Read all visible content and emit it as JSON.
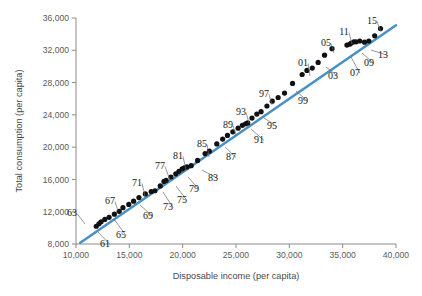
{
  "chart_data": {
    "type": "scatter",
    "title": "",
    "subtitle": "",
    "xlabel": "Disposable income (per capita)",
    "ylabel": "Total consumption (per capita)",
    "xlim": [
      10000,
      40000
    ],
    "ylim": [
      8000,
      36000
    ],
    "xticks": [
      10000,
      15000,
      20000,
      25000,
      30000,
      35000,
      40000
    ],
    "yticks": [
      8000,
      12000,
      16000,
      20000,
      24000,
      28000,
      32000,
      36000
    ],
    "xtick_labels": [
      "10,000",
      "15,000",
      "20,000",
      "25,000",
      "30,000",
      "35,000",
      "40,000"
    ],
    "ytick_labels": [
      "8,000",
      "12,000",
      "16,000",
      "20,000",
      "24,000",
      "28,000",
      "32,000",
      "36,000"
    ],
    "grid": false,
    "legend": null,
    "series_name": "Annual observations 1961-2015",
    "point_color": "#111111",
    "trendline": {
      "type": "linear-fit",
      "color": "#4a90c4",
      "x_start": 10400,
      "y_start": 8150,
      "x_end": 40000,
      "y_end": 35100
    },
    "points": [
      {
        "label": "61",
        "x": 11900,
        "y": 10200
      },
      {
        "label": "62",
        "x": 12150,
        "y": 10500
      },
      {
        "label": "63",
        "x": 12350,
        "y": 10750
      },
      {
        "label": "64",
        "x": 12700,
        "y": 11050
      },
      {
        "label": "65",
        "x": 13100,
        "y": 11300
      },
      {
        "label": "66",
        "x": 13600,
        "y": 11700
      },
      {
        "label": "67",
        "x": 14050,
        "y": 12050
      },
      {
        "label": "68",
        "x": 14400,
        "y": 12500
      },
      {
        "label": "69",
        "x": 14950,
        "y": 12900
      },
      {
        "label": "70",
        "x": 15400,
        "y": 13300
      },
      {
        "label": "71",
        "x": 15900,
        "y": 13750
      },
      {
        "label": "72",
        "x": 16500,
        "y": 14200
      },
      {
        "label": "73",
        "x": 17050,
        "y": 14500
      },
      {
        "label": "74",
        "x": 17400,
        "y": 14600
      },
      {
        "label": "75",
        "x": 17900,
        "y": 15200
      },
      {
        "label": "76",
        "x": 18250,
        "y": 15750
      },
      {
        "label": "77",
        "x": 18450,
        "y": 15900
      },
      {
        "label": "78",
        "x": 18900,
        "y": 16300
      },
      {
        "label": "79",
        "x": 19350,
        "y": 16700
      },
      {
        "label": "80",
        "x": 19650,
        "y": 17000
      },
      {
        "label": "81",
        "x": 19950,
        "y": 17300
      },
      {
        "label": "82",
        "x": 20150,
        "y": 17450
      },
      {
        "label": "83",
        "x": 20400,
        "y": 17550
      },
      {
        "label": "84",
        "x": 20800,
        "y": 17700
      },
      {
        "label": "85",
        "x": 21400,
        "y": 18350
      },
      {
        "label": "86",
        "x": 22100,
        "y": 19200
      },
      {
        "label": "87",
        "x": 22500,
        "y": 19500
      },
      {
        "label": "88",
        "x": 23200,
        "y": 20400
      },
      {
        "label": "89",
        "x": 23750,
        "y": 21000
      },
      {
        "label": "90",
        "x": 24200,
        "y": 21450
      },
      {
        "label": "91",
        "x": 24700,
        "y": 21900
      },
      {
        "label": "92",
        "x": 25200,
        "y": 22350
      },
      {
        "label": "93",
        "x": 25600,
        "y": 22700
      },
      {
        "label": "94",
        "x": 25900,
        "y": 22900
      },
      {
        "label": "95",
        "x": 26100,
        "y": 23000
      },
      {
        "label": "96",
        "x": 26500,
        "y": 23600
      },
      {
        "label": "97",
        "x": 26950,
        "y": 24100
      },
      {
        "label": "98",
        "x": 27350,
        "y": 24400
      },
      {
        "label": "99",
        "x": 27900,
        "y": 25100
      },
      {
        "label": "00",
        "x": 28400,
        "y": 25700
      },
      {
        "label": "01",
        "x": 28950,
        "y": 26150
      },
      {
        "label": "02",
        "x": 29550,
        "y": 26700
      },
      {
        "label": "03",
        "x": 30300,
        "y": 27900
      },
      {
        "label": "04",
        "x": 31200,
        "y": 29000
      },
      {
        "label": "05",
        "x": 31650,
        "y": 29500
      },
      {
        "label": "06",
        "x": 32150,
        "y": 29800
      },
      {
        "label": "07",
        "x": 32700,
        "y": 30500
      },
      {
        "label": "08",
        "x": 33300,
        "y": 31400
      },
      {
        "label": "09",
        "x": 34000,
        "y": 32200
      },
      {
        "label": "10",
        "x": 35400,
        "y": 32650
      },
      {
        "label": "11",
        "x": 35650,
        "y": 32750
      },
      {
        "label": "12",
        "x": 35800,
        "y": 32900
      },
      {
        "label": "13",
        "x": 36050,
        "y": 33050
      },
      {
        "label": "14",
        "x": 36250,
        "y": 33050
      },
      {
        "label": "15",
        "x": 36600,
        "y": 33150
      },
      {
        "label": "16",
        "x": 37050,
        "y": 33000
      },
      {
        "label": "17",
        "x": 37450,
        "y": 33150
      },
      {
        "label": "18",
        "x": 38000,
        "y": 33800
      },
      {
        "label": "19",
        "x": 38550,
        "y": 34700
      }
    ],
    "annotations": [
      {
        "text": "63",
        "x": 72,
        "y": 212,
        "lx": 85,
        "ly": 224
      },
      {
        "text": "61",
        "x": 105,
        "y": 243,
        "lx": 98,
        "ly": 232
      },
      {
        "text": "65",
        "x": 121,
        "y": 234,
        "lx": 114,
        "ly": 219
      },
      {
        "text": "67",
        "x": 110,
        "y": 200,
        "lx": 118,
        "ly": 211
      },
      {
        "text": "69",
        "x": 148,
        "y": 215,
        "lx": 140,
        "ly": 205
      },
      {
        "text": "71",
        "x": 137,
        "y": 182,
        "lx": 145,
        "ly": 196
      },
      {
        "text": "73",
        "x": 168,
        "y": 206,
        "lx": 163,
        "ly": 192
      },
      {
        "text": "75",
        "x": 182,
        "y": 199,
        "lx": 176,
        "ly": 186
      },
      {
        "text": "77",
        "x": 160,
        "y": 165,
        "lx": 170,
        "ly": 180
      },
      {
        "text": "79",
        "x": 194,
        "y": 188,
        "lx": 188,
        "ly": 177
      },
      {
        "text": "81",
        "x": 178,
        "y": 155,
        "lx": 186,
        "ly": 170
      },
      {
        "text": "83",
        "x": 213,
        "y": 177,
        "lx": 202,
        "ly": 170
      },
      {
        "text": "85",
        "x": 202,
        "y": 143,
        "lx": 209,
        "ly": 157
      },
      {
        "text": "87",
        "x": 231,
        "y": 156,
        "lx": 225,
        "ly": 147
      },
      {
        "text": "89",
        "x": 228,
        "y": 124,
        "lx": 236,
        "ly": 136
      },
      {
        "text": "91",
        "x": 259,
        "y": 139,
        "lx": 251,
        "ly": 129
      },
      {
        "text": "93",
        "x": 241,
        "y": 111,
        "lx": 249,
        "ly": 123
      },
      {
        "text": "95",
        "x": 272,
        "y": 125,
        "lx": 264,
        "ly": 118
      },
      {
        "text": "97",
        "x": 264,
        "y": 93,
        "lx": 272,
        "ly": 105
      },
      {
        "text": "99",
        "x": 303,
        "y": 100,
        "lx": 296,
        "ly": 91
      },
      {
        "text": "01",
        "x": 303,
        "y": 62,
        "lx": 310,
        "ly": 76
      },
      {
        "text": "03",
        "x": 333,
        "y": 75,
        "lx": 326,
        "ly": 67
      },
      {
        "text": "05",
        "x": 326,
        "y": 42,
        "lx": 334,
        "ly": 53
      },
      {
        "text": "07",
        "x": 355,
        "y": 72,
        "lx": 351,
        "ly": 57
      },
      {
        "text": "09",
        "x": 369,
        "y": 62,
        "lx": 362,
        "ly": 53
      },
      {
        "text": "11",
        "x": 344,
        "y": 31,
        "lx": 352,
        "ly": 44
      },
      {
        "text": "13",
        "x": 383,
        "y": 54,
        "lx": 371,
        "ly": 50
      },
      {
        "text": "15",
        "x": 372,
        "y": 20,
        "lx": 381,
        "ly": 32
      }
    ]
  }
}
